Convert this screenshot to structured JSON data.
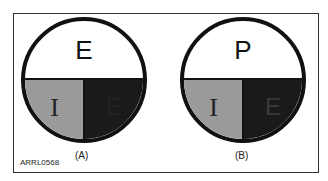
{
  "figure_code": "ARRL0568",
  "panels": [
    {
      "caption": "(A)",
      "top_label": "E",
      "left_label": "I",
      "right_label": "E",
      "right_label_color": "#222222"
    },
    {
      "caption": "(B)",
      "top_label": "P",
      "left_label": "I",
      "right_label": "E",
      "right_label_color": "#333333"
    }
  ],
  "colors": {
    "left_quadrant": "#9a9a9a",
    "right_quadrant": "#1a1a1a",
    "outline": "#111111"
  }
}
